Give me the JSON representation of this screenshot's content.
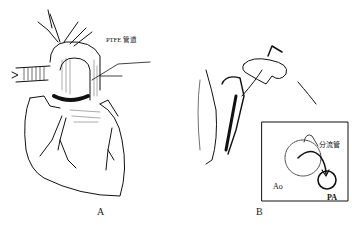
{
  "figure": {
    "panels": [
      {
        "id": "A",
        "label": "A",
        "description": "Anterior view of heart with PTFE conduit around aorta",
        "callouts": [
          {
            "text": "PTFE 管道"
          }
        ]
      },
      {
        "id": "B",
        "label": "B",
        "description": "Surgical view with inset schematic of shunt from Ao to PA",
        "inset": {
          "shunt_label": "分流管",
          "aorta_label": "Ao",
          "pa_label": "PA"
        }
      }
    ]
  }
}
